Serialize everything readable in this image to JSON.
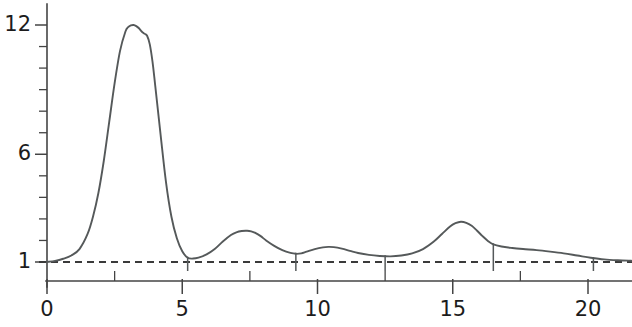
{
  "chart_data": {
    "type": "line",
    "title": "",
    "subtitle": "",
    "xlabel": "",
    "ylabel": "",
    "xlim": [
      0,
      21.8
    ],
    "ylim": [
      0.45,
      12.7
    ],
    "grid": false,
    "legend": null,
    "x_ticks_labeled": [
      0,
      5,
      10,
      15,
      20
    ],
    "x_tick_labels": [
      "0",
      "5",
      "10",
      "15",
      "20"
    ],
    "x_ticks_minor": [
      2.5,
      7.5,
      12.5,
      17.5
    ],
    "y_ticks_labeled": [
      1,
      6,
      12
    ],
    "y_tick_labels": [
      "1",
      "6",
      "12"
    ],
    "y_ticks_minor": [
      2,
      3,
      4,
      5,
      7,
      8,
      9,
      10,
      11
    ],
    "baseline": {
      "value": 1,
      "style": "dashed",
      "label": "1"
    },
    "peak_markers_x": [
      5.2,
      9.2,
      12.5,
      16.5,
      20.2
    ],
    "series": [
      {
        "name": "signal",
        "color": "#55595a",
        "x": [
          0.0,
          0.3,
          0.6,
          0.9,
          1.2,
          1.5,
          1.7,
          1.9,
          2.1,
          2.3,
          2.5,
          2.7,
          2.9,
          3.0,
          3.1,
          3.2,
          3.3,
          3.4,
          3.5,
          3.6,
          3.7,
          3.8,
          3.9,
          4.0,
          4.2,
          4.4,
          4.6,
          4.8,
          5.0,
          5.2,
          5.4,
          5.6,
          5.9,
          6.2,
          6.5,
          6.8,
          7.0,
          7.2,
          7.4,
          7.55,
          7.7,
          7.9,
          8.1,
          8.4,
          8.7,
          9.0,
          9.2,
          9.4,
          9.6,
          9.9,
          10.2,
          10.4,
          10.6,
          10.9,
          11.2,
          11.5,
          11.9,
          12.3,
          12.7,
          13.1,
          13.5,
          13.9,
          14.3,
          14.6,
          14.9,
          15.1,
          15.3,
          15.5,
          15.7,
          15.9,
          16.1,
          16.3,
          16.5,
          16.8,
          17.2,
          17.6,
          18.1,
          18.6,
          19.1,
          19.6,
          20.1,
          20.6,
          21.1,
          21.6
        ],
        "y": [
          1.0,
          1.05,
          1.15,
          1.3,
          1.6,
          2.3,
          3.1,
          4.2,
          5.7,
          7.5,
          9.3,
          10.8,
          11.7,
          11.9,
          11.98,
          12.0,
          11.95,
          11.85,
          11.7,
          11.6,
          11.5,
          11.1,
          10.3,
          9.2,
          6.9,
          4.7,
          3.1,
          2.1,
          1.5,
          1.2,
          1.16,
          1.2,
          1.35,
          1.6,
          1.95,
          2.25,
          2.38,
          2.44,
          2.45,
          2.42,
          2.35,
          2.2,
          2.0,
          1.75,
          1.55,
          1.42,
          1.38,
          1.4,
          1.48,
          1.6,
          1.68,
          1.7,
          1.69,
          1.62,
          1.52,
          1.42,
          1.33,
          1.28,
          1.26,
          1.3,
          1.4,
          1.6,
          1.95,
          2.3,
          2.65,
          2.8,
          2.87,
          2.82,
          2.68,
          2.45,
          2.2,
          1.98,
          1.82,
          1.72,
          1.65,
          1.6,
          1.55,
          1.48,
          1.4,
          1.3,
          1.2,
          1.12,
          1.08,
          1.06
        ]
      }
    ],
    "peaks": [
      {
        "x": 3.2,
        "y": 12.0,
        "label": "main-peak"
      },
      {
        "x": 7.5,
        "y": 2.45,
        "label": "peak-2"
      },
      {
        "x": 10.4,
        "y": 1.7,
        "label": "peak-3"
      },
      {
        "x": 15.3,
        "y": 2.87,
        "label": "peak-4"
      }
    ]
  }
}
